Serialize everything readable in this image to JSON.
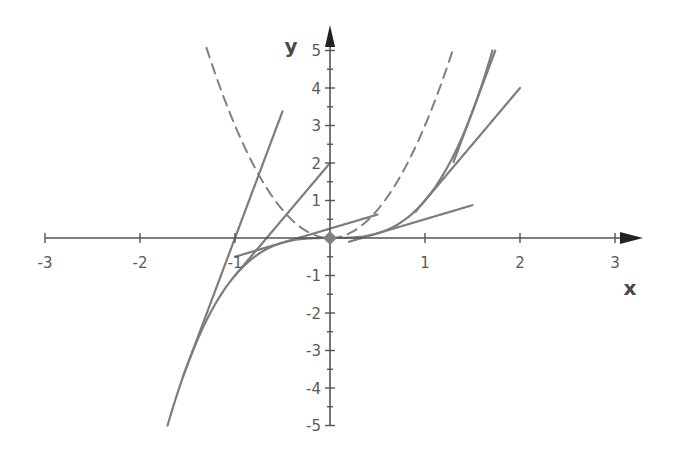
{
  "chart_data": {
    "type": "line",
    "title": "",
    "xlabel": "x",
    "ylabel": "y",
    "xlim": [
      -3,
      3.3
    ],
    "ylim": [
      -5,
      5.5
    ],
    "grid": false,
    "legend": "none",
    "x_ticks": [
      {
        "value": -3,
        "label": "-3"
      },
      {
        "value": -2,
        "label": "-2"
      },
      {
        "value": -1,
        "label": "-1"
      },
      {
        "value": 1,
        "label": "1"
      },
      {
        "value": 2,
        "label": "2"
      },
      {
        "value": 3,
        "label": "3"
      }
    ],
    "y_ticks": [
      {
        "value": 5,
        "label": "5"
      },
      {
        "value": 4,
        "label": "4"
      },
      {
        "value": 3,
        "label": "3"
      },
      {
        "value": 2,
        "label": "2"
      },
      {
        "value": 1,
        "label": "1"
      },
      {
        "value": -1,
        "label": "-1"
      },
      {
        "value": -2,
        "label": "-2"
      },
      {
        "value": -3,
        "label": "-3"
      },
      {
        "value": -4,
        "label": "-4"
      },
      {
        "value": -5,
        "label": "-5"
      }
    ],
    "y_minor_step": 0.5,
    "series": [
      {
        "name": "f(x) = x^3",
        "style": "solid",
        "coefficients": [
          0,
          0,
          0,
          1
        ],
        "x_range": [
          -1.71,
          1.71
        ]
      },
      {
        "name": "f'(x) = 3x^2",
        "style": "dashed",
        "coefficients": [
          0,
          0,
          3,
          0
        ],
        "x_range": [
          -1.3,
          1.3
        ]
      },
      {
        "name": "tangent at x=-1.5",
        "style": "solid",
        "coefficients": [
          6.75,
          6.75
        ],
        "x_range": [
          -1.55,
          -0.5
        ]
      },
      {
        "name": "tangent at x=-1",
        "style": "solid",
        "coefficients": [
          2,
          3
        ],
        "x_range": [
          -1.0,
          0
        ]
      },
      {
        "name": "tangent at x=-0.5",
        "style": "solid",
        "coefficients": [
          0.25,
          0.75
        ],
        "x_range": [
          -1.0,
          0.5
        ]
      },
      {
        "name": "tangent at x=0.5",
        "style": "solid",
        "coefficients": [
          -0.25,
          0.75
        ],
        "x_range": [
          0.2,
          1.5
        ]
      },
      {
        "name": "tangent at x=1",
        "style": "solid",
        "coefficients": [
          -2,
          3
        ],
        "x_range": [
          0.9,
          2.0
        ]
      },
      {
        "name": "tangent at x=1.5",
        "style": "solid",
        "coefficients": [
          -6.75,
          6.75
        ],
        "x_range": [
          1.3,
          1.74
        ]
      }
    ],
    "points": [
      {
        "name": "origin",
        "x": 0,
        "y": 0,
        "marker": "diamond"
      }
    ],
    "colors": {
      "curve": "#7d7d7d",
      "dashed": "#808080",
      "axis": "#555555",
      "marker": "#808080"
    }
  }
}
